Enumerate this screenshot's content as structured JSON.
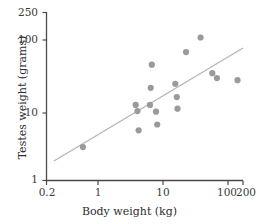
{
  "chart_data": {
    "type": "scatter",
    "title": "",
    "xlabel": "Body weight (kg)",
    "ylabel": "Testes weight (grams)",
    "xscale": "log",
    "yscale": "log",
    "xlim": [
      0.2,
      200
    ],
    "ylim": [
      1,
      250
    ],
    "grid": false,
    "legend": null,
    "xticks": [
      {
        "value": 0.2,
        "label": "0.2"
      },
      {
        "value": 1,
        "label": "1"
      },
      {
        "value": 10,
        "label": "10"
      },
      {
        "value": 100,
        "label": "100"
      },
      {
        "value": 200,
        "label": "200"
      }
    ],
    "yticks": [
      {
        "value": 1,
        "label": "1"
      },
      {
        "value": 10,
        "label": "10"
      },
      {
        "value": 100,
        "label": "100"
      },
      {
        "value": 250,
        "label": "250"
      }
    ],
    "series": [
      {
        "name": "primates",
        "marker": "circle",
        "color": "#9a9a9a",
        "points": [
          {
            "x": 0.72,
            "y": 3.0
          },
          {
            "x": 4.6,
            "y": 12.0
          },
          {
            "x": 4.9,
            "y": 9.8
          },
          {
            "x": 5.1,
            "y": 5.2
          },
          {
            "x": 7.6,
            "y": 12.0
          },
          {
            "x": 7.8,
            "y": 21.0
          },
          {
            "x": 8.1,
            "y": 45.0
          },
          {
            "x": 9.4,
            "y": 9.6
          },
          {
            "x": 9.8,
            "y": 6.3
          },
          {
            "x": 18.5,
            "y": 24.0
          },
          {
            "x": 19.5,
            "y": 15.5
          },
          {
            "x": 20.0,
            "y": 10.6
          },
          {
            "x": 27.0,
            "y": 68.0
          },
          {
            "x": 45.0,
            "y": 110.0
          },
          {
            "x": 68.0,
            "y": 34.0
          },
          {
            "x": 80.0,
            "y": 29.0
          },
          {
            "x": 165.0,
            "y": 27.0
          }
        ]
      }
    ],
    "trendline": {
      "name": "regression-line",
      "color": "#b5b5b5",
      "x_start": 0.26,
      "y_start": 1.9,
      "x_end": 200,
      "y_end": 78
    }
  }
}
